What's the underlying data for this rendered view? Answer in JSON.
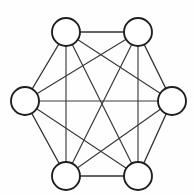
{
  "figure": {
    "background_color": "#fefefe",
    "node_stroke_color": "#1f1f1f",
    "node_fill_color": "#ffffff",
    "edge_color": "#3a3a3a",
    "node_radius": 14,
    "node_count": 6,
    "edge_count": 15
  },
  "chart_data": {
    "type": "diagram",
    "graph_type": "complete-graph",
    "name": "K6",
    "node_count": 6,
    "edge_count": 15,
    "degree_per_node": 5,
    "layout": "regular-hexagon",
    "nodes": [
      {
        "id": "n1",
        "label": "",
        "position": "top-left",
        "cx": 66,
        "cy": 32,
        "r": 14
      },
      {
        "id": "n2",
        "label": "",
        "position": "top-right",
        "cx": 138,
        "cy": 32,
        "r": 14
      },
      {
        "id": "n3",
        "label": "",
        "position": "right",
        "cx": 172,
        "cy": 101,
        "r": 14
      },
      {
        "id": "n4",
        "label": "",
        "position": "bottom-right",
        "cx": 138,
        "cy": 176,
        "r": 14
      },
      {
        "id": "n5",
        "label": "",
        "position": "bottom-left",
        "cx": 66,
        "cy": 176,
        "r": 14
      },
      {
        "id": "n6",
        "label": "",
        "position": "left",
        "cx": 25,
        "cy": 101,
        "r": 14
      }
    ],
    "edges": [
      {
        "from": "n1",
        "to": "n2",
        "kind": "hexagon-side"
      },
      {
        "from": "n2",
        "to": "n3",
        "kind": "hexagon-side"
      },
      {
        "from": "n3",
        "to": "n4",
        "kind": "hexagon-side"
      },
      {
        "from": "n4",
        "to": "n5",
        "kind": "hexagon-side"
      },
      {
        "from": "n5",
        "to": "n6",
        "kind": "hexagon-side"
      },
      {
        "from": "n6",
        "to": "n1",
        "kind": "hexagon-side"
      },
      {
        "from": "n1",
        "to": "n4",
        "kind": "long-diagonal"
      },
      {
        "from": "n2",
        "to": "n5",
        "kind": "long-diagonal"
      },
      {
        "from": "n3",
        "to": "n6",
        "kind": "long-diagonal"
      },
      {
        "from": "n1",
        "to": "n3",
        "kind": "short-diagonal"
      },
      {
        "from": "n1",
        "to": "n5",
        "kind": "short-diagonal"
      },
      {
        "from": "n2",
        "to": "n4",
        "kind": "short-diagonal"
      },
      {
        "from": "n2",
        "to": "n6",
        "kind": "short-diagonal"
      },
      {
        "from": "n3",
        "to": "n5",
        "kind": "short-diagonal"
      },
      {
        "from": "n4",
        "to": "n6",
        "kind": "short-diagonal"
      }
    ],
    "xlabel": "",
    "ylabel": "",
    "legend": [],
    "annotations": []
  }
}
